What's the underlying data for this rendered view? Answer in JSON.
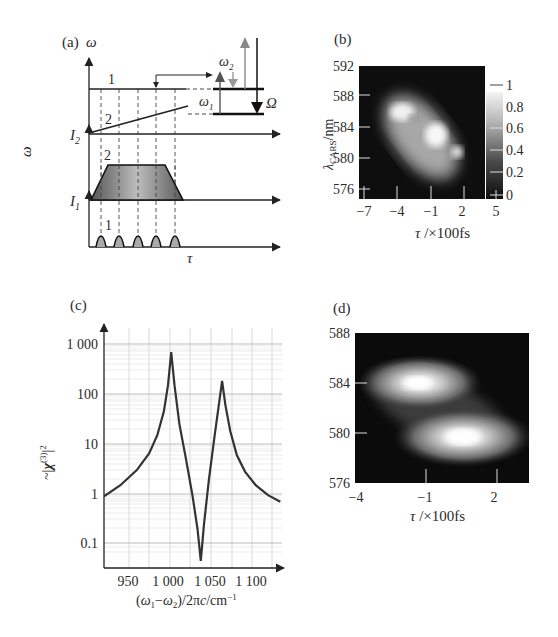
{
  "figure": {
    "panels": {
      "a": {
        "label": "(a)",
        "omega_top_label": "ω",
        "omega_side_label": "ω",
        "i2_label": "I",
        "i2_sub": "2",
        "i1_label": "I",
        "i1_sub": "1",
        "tau_label": "τ",
        "line1_label": "1",
        "line2_label": "2",
        "trap_label": "2",
        "pulses_label": "1",
        "omega1_label": "ω",
        "omega1_sub": "1",
        "omega2_label": "ω",
        "omega2_sub": "2",
        "Omega_label": "Ω",
        "pulse_count": 5
      },
      "b": {
        "label": "(b)",
        "ylabel_main": "λ",
        "ylabel_sub": "CARS",
        "ylabel_unit": "/nm",
        "xlabel": "τ /×100fs",
        "yticks": [
          "592",
          "588",
          "584",
          "580",
          "576"
        ],
        "xticks": [
          "−7",
          "−4",
          "−1",
          "2",
          "5"
        ],
        "colorbar_ticks": [
          "1",
          "0.8",
          "0.6",
          "0.4",
          "0.2",
          "0"
        ]
      },
      "c": {
        "label": "(c)",
        "ylabel": "~|χ(3)|2",
        "xlabel": "(ω1−ω2)/2πc/cm−1",
        "yticks": [
          "1 000",
          "100",
          "10",
          "1",
          "0.1"
        ],
        "xticks": [
          "950",
          "1 000",
          "1 050",
          "1 100"
        ]
      },
      "d": {
        "label": "(d)",
        "yticks": [
          "588",
          "584",
          "580",
          "576"
        ],
        "xticks": [
          "−4",
          "−1",
          "2"
        ],
        "xlabel": "τ /×100fs"
      }
    }
  },
  "chart_data": [
    {
      "panel": "a",
      "type": "diagram",
      "title": "(a) Spectral-focusing timing scheme",
      "xlabel": "τ",
      "ylabel": "ω",
      "traces": [
        {
          "name": "1",
          "description": "beam 1: constant frequency ω (horizontal line), short pulse train (5 pulses) in intensity I1"
        },
        {
          "name": "2",
          "description": "beam 2: linearly chirped frequency (rising line), long trapezoidal pulse in intensity I2"
        }
      ],
      "energy_levels": {
        "arrows": [
          "ω1 (up)",
          "ω2 (down)",
          "probe (up)",
          "anti-Stokes (down)"
        ],
        "transition": "Ω"
      }
    },
    {
      "panel": "b",
      "type": "heatmap",
      "title": "(b) measured CARS spectrogram",
      "xlabel": "τ/×100fs",
      "ylabel": "λCARS/nm",
      "xlim": [
        -7.8,
        5.5
      ],
      "ylim": [
        575,
        592
      ],
      "xticks": [
        -7,
        -4,
        -1,
        2,
        5
      ],
      "yticks": [
        576,
        580,
        584,
        588,
        592
      ],
      "colorbar": {
        "range": [
          0,
          1
        ],
        "ticks": [
          0,
          0.2,
          0.4,
          0.6,
          0.8,
          1
        ],
        "colormap": "gray"
      },
      "features": [
        {
          "tau": -3.0,
          "lambda": 583.5,
          "intensity": 0.95
        },
        {
          "tau": -0.5,
          "lambda": 580.5,
          "intensity": 1.0
        },
        {
          "tau": 1.8,
          "lambda": 578.0,
          "intensity": 0.9
        }
      ]
    },
    {
      "panel": "c",
      "type": "line",
      "title": "(c) |χ(3)|² spectrum",
      "xlabel": "(ω1−ω2)/2πc/cm−1",
      "ylabel": "~|χ(3)|2",
      "yscale": "log",
      "xlim": [
        920,
        1135
      ],
      "ylim": [
        0.03,
        2500
      ],
      "xticks": [
        950,
        1000,
        1050,
        1100
      ],
      "yticks": [
        1000,
        100,
        10,
        1,
        0.1
      ],
      "grid": true,
      "x": [
        920,
        940,
        960,
        975,
        985,
        993,
        998,
        1002,
        1006,
        1012,
        1020,
        1028,
        1034,
        1038,
        1042,
        1048,
        1055,
        1060,
        1064,
        1068,
        1074,
        1082,
        1092,
        1105,
        1120,
        1135
      ],
      "y": [
        0.9,
        1.5,
        3.0,
        6.5,
        15,
        45,
        150,
        690,
        150,
        25,
        5,
        0.9,
        0.2,
        0.046,
        0.25,
        2.0,
        15,
        60,
        182,
        60,
        18,
        6,
        2.8,
        1.5,
        0.95,
        0.7
      ]
    },
    {
      "panel": "d",
      "type": "heatmap",
      "title": "(d) simulated CARS spectrogram",
      "xlabel": "τ/×100fs",
      "ylabel": "λCARS/nm",
      "xlim": [
        -4,
        2.5
      ],
      "ylim": [
        576,
        588
      ],
      "xticks": [
        -4,
        -1,
        2
      ],
      "yticks": [
        576,
        580,
        584,
        588
      ],
      "colormap": "gray",
      "features": [
        {
          "tau": -1.2,
          "lambda": 584.0,
          "intensity": 1.0
        },
        {
          "tau": 0.9,
          "lambda": 579.7,
          "intensity": 1.0
        }
      ]
    }
  ]
}
